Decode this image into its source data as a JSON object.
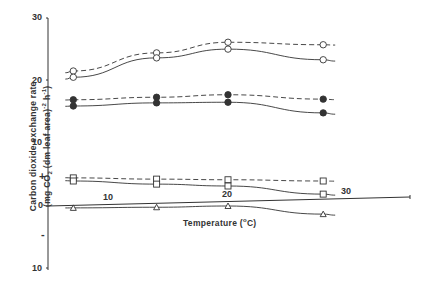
{
  "chart_data": {
    "type": "line",
    "title": "",
    "xlabel": "Temperature (°C)",
    "ylabel": "Carbon dioxide exchange rate (mg CO2 (dm leaf area)^-2 h^-1)",
    "ylabel_line1": "Carbon dioxide exchange rate",
    "ylabel_line2": "(mg CO2 (dm leaf area)-2 h-1)",
    "x_ticks": [
      "10",
      "20",
      "30"
    ],
    "y_ticks": [
      "30",
      "20",
      "10",
      "+",
      "0",
      "-",
      "10"
    ],
    "y_tick_values": [
      30,
      20,
      10,
      0,
      -10
    ],
    "ylim": [
      -10,
      30
    ],
    "xlim": [
      4,
      35
    ],
    "grid": false,
    "legend": "none",
    "x": [
      7,
      14,
      20,
      28
    ],
    "series": [
      {
        "name": "open circles (dashed)",
        "marker": "open-circle",
        "line": "dashed",
        "values": [
          21.6,
          24.5,
          26.2,
          25.8
        ]
      },
      {
        "name": "open circles (solid)",
        "marker": "open-circle",
        "line": "solid",
        "values": [
          20.6,
          23.7,
          25.1,
          23.4
        ]
      },
      {
        "name": "filled circles (dashed)",
        "marker": "filled-circle",
        "line": "dashed",
        "values": [
          17.0,
          17.4,
          17.8,
          17.1
        ]
      },
      {
        "name": "filled circles (solid)",
        "marker": "filled-circle",
        "line": "solid",
        "values": [
          16.0,
          16.5,
          16.6,
          14.9
        ]
      },
      {
        "name": "open squares (dashed)",
        "marker": "open-square",
        "line": "dashed",
        "values": [
          4.5,
          4.3,
          4.2,
          4.0
        ]
      },
      {
        "name": "open squares (solid)",
        "marker": "open-square",
        "line": "solid",
        "values": [
          4.0,
          3.5,
          3.2,
          1.9
        ]
      },
      {
        "name": "open triangles (solid)",
        "marker": "open-triangle",
        "line": "solid",
        "values": [
          -0.3,
          -0.2,
          0.0,
          -1.3
        ]
      }
    ]
  },
  "axis": {
    "y_labels": {
      "t30": "30",
      "t20": "20",
      "t10": "10",
      "plus": "+",
      "t0": "0",
      "minus": "-",
      "tm10": "10"
    },
    "x_labels": {
      "t10": "10",
      "t20": "20",
      "t30": "30"
    },
    "xlabel_text": "Temperature (",
    "xlabel_unit": "o",
    "xlabel_end": "C)",
    "ylabel_l1": "Carbon dioxide exchange rate",
    "ylabel_l2a": "(mg CO",
    "ylabel_l2sub": "2",
    "ylabel_l2b": " (dm leaf area)",
    "ylabel_l2sup1": "-2",
    "ylabel_l2c": " h",
    "ylabel_l2sup2": "-1",
    "ylabel_l2d": ")"
  },
  "colors": {
    "ink": "#333333",
    "background": "#ffffff"
  }
}
